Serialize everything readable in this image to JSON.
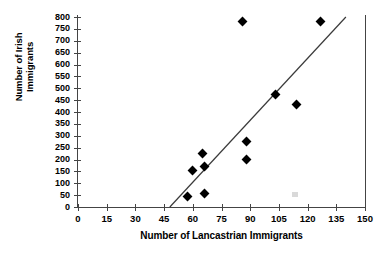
{
  "chart_data": {
    "type": "scatter",
    "title": "",
    "xlabel": "Number of Lancastrian Immigrants",
    "ylabel": "Number of Irish Immigrants",
    "xlim": [
      0,
      150
    ],
    "ylim": [
      0,
      800
    ],
    "xticks": [
      0,
      15,
      30,
      45,
      60,
      75,
      90,
      105,
      120,
      135,
      150
    ],
    "yticks": [
      0,
      50,
      100,
      150,
      200,
      250,
      300,
      350,
      400,
      450,
      500,
      550,
      600,
      650,
      700,
      750,
      800
    ],
    "grid": false,
    "legend": "none",
    "marker": "filled-diamond",
    "marker_color": "#000000",
    "points": [
      {
        "x": 57,
        "y": 45
      },
      {
        "x": 66,
        "y": 55
      },
      {
        "x": 60,
        "y": 155
      },
      {
        "x": 66,
        "y": 170
      },
      {
        "x": 65,
        "y": 225
      },
      {
        "x": 88,
        "y": 200
      },
      {
        "x": 88,
        "y": 275
      },
      {
        "x": 103,
        "y": 475
      },
      {
        "x": 114,
        "y": 430
      },
      {
        "x": 86,
        "y": 780
      },
      {
        "x": 127,
        "y": 780
      }
    ],
    "trendline": {
      "type": "linear-fit",
      "x_start": 48,
      "y_start": 0,
      "x_end": 140,
      "y_end": 800,
      "color": "#3a3a3a"
    }
  },
  "axes": {
    "y_title_line1": "Number of Irish",
    "y_title_line2": "Immigrants",
    "x_title": "Number of Lancastrian Immigrants"
  }
}
